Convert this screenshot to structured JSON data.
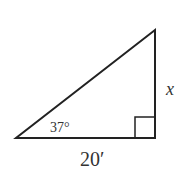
{
  "diagram": {
    "type": "right-triangle",
    "angle_label": "37°",
    "side_vertical_label": "x",
    "side_base_label": "20′",
    "stroke_color": "#222222"
  }
}
